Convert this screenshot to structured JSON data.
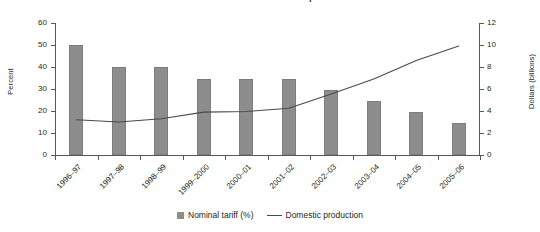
{
  "chart_data": {
    "type": "bar",
    "title": "Nominal tariff and domestic production",
    "categories": [
      "1996–97",
      "1997–98",
      "1998–99",
      "1999–2000",
      "2000–01",
      "2001–02",
      "2002–03",
      "2003–04",
      "2004–05",
      "2005–06"
    ],
    "series": [
      {
        "name": "Nominal tariff (%)",
        "type": "bar",
        "axis": "left",
        "color": "#8d8d8d",
        "values": [
          50.2,
          40.0,
          40.0,
          34.5,
          34.5,
          34.5,
          29.5,
          24.5,
          19.5,
          14.5
        ]
      },
      {
        "name": "Domestic production",
        "type": "line",
        "axis": "right",
        "color": "#4a4a4a",
        "values": [
          3.2,
          3.0,
          3.3,
          3.9,
          3.95,
          4.25,
          5.55,
          6.9,
          8.6,
          9.9
        ]
      }
    ],
    "xlabel": "",
    "ylabel": "Percent",
    "y2label": "Dollars (billions)",
    "ylim": [
      0,
      60
    ],
    "y2lim": [
      0,
      12
    ],
    "yticks": [
      0,
      10,
      20,
      30,
      40,
      50,
      60
    ],
    "y2ticks": [
      0,
      2,
      4,
      6,
      8,
      10,
      12
    ],
    "grid": false,
    "legend_position": "bottom"
  },
  "legend": {
    "bar_label": "Nominal tariff (%)",
    "line_label": "Domestic production"
  },
  "axes": {
    "left_title": "Percent",
    "right_title": "Dollars (billions)"
  }
}
